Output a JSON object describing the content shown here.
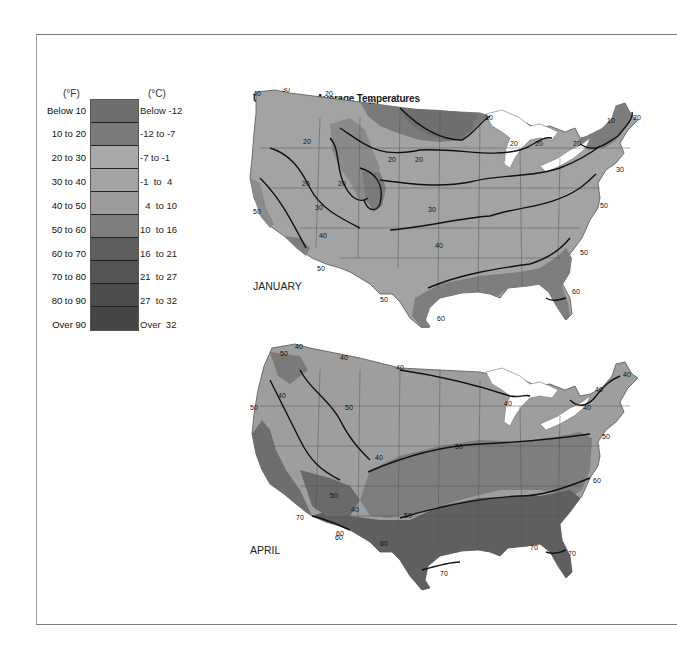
{
  "title": "United States Average Temperatures",
  "legend": {
    "header_f": "(°F)",
    "header_c": "(°C)",
    "items": [
      {
        "f": "Below 10",
        "c": "Below -12",
        "color": "#6e6e6e"
      },
      {
        "f": "10 to 20",
        "c": "-12 to -7",
        "color": "#7b7b7b"
      },
      {
        "f": "20 to 30",
        "c": "-7 to -1",
        "color": "#a9a9a9"
      },
      {
        "f": "30 to 40",
        "c": "-1  to  4",
        "color": "#a4a4a4"
      },
      {
        "f": "40 to 50",
        "c": "  4  to 10",
        "color": "#9c9c9c"
      },
      {
        "f": "50 to 60",
        "c": "10  to 16",
        "color": "#7e7e7e"
      },
      {
        "f": "60 to 70",
        "c": "16  to 21",
        "color": "#5e5e5e"
      },
      {
        "f": "70 to 80",
        "c": "21  to 27",
        "color": "#545454"
      },
      {
        "f": "80 to 90",
        "c": "27  to 32",
        "color": "#4c4c4c"
      },
      {
        "f": "Over 90",
        "c": "Over  32",
        "color": "#454545"
      }
    ]
  },
  "maps": [
    {
      "label": "JANUARY",
      "isotherm_labels": [
        "40",
        "30",
        "20",
        "10",
        "10",
        "20",
        "20",
        "20",
        "10",
        "20",
        "20",
        "20",
        "20",
        "30",
        "20",
        "20",
        "30",
        "50",
        "40",
        "30",
        "40",
        "50",
        "50",
        "50",
        "50",
        "60",
        "60"
      ]
    },
    {
      "label": "APRIL",
      "isotherm_labels": [
        "50",
        "40",
        "40",
        "40",
        "40",
        "50",
        "40",
        "50",
        "40",
        "40",
        "40",
        "40",
        "50",
        "50",
        "60",
        "60",
        "40",
        "50",
        "50",
        "60",
        "70",
        "60",
        "70",
        "70",
        "70"
      ]
    }
  ],
  "colors": {
    "map_base": "#a3a3a3",
    "zone_cold": "#7a7a7a",
    "zone_warm": "#7e7e7e",
    "zone_hot": "#5f5f5f",
    "isotherm": "#111111",
    "lake": "#ffffff"
  }
}
